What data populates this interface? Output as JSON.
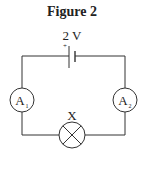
{
  "title": "Figure 2",
  "battery": {
    "voltage_label": "2 V",
    "positive_mark": "+"
  },
  "ammeters": [
    {
      "label": "A",
      "subscript": "1"
    },
    {
      "label": "A",
      "subscript": "2"
    }
  ],
  "lamp": {
    "label": "X"
  }
}
